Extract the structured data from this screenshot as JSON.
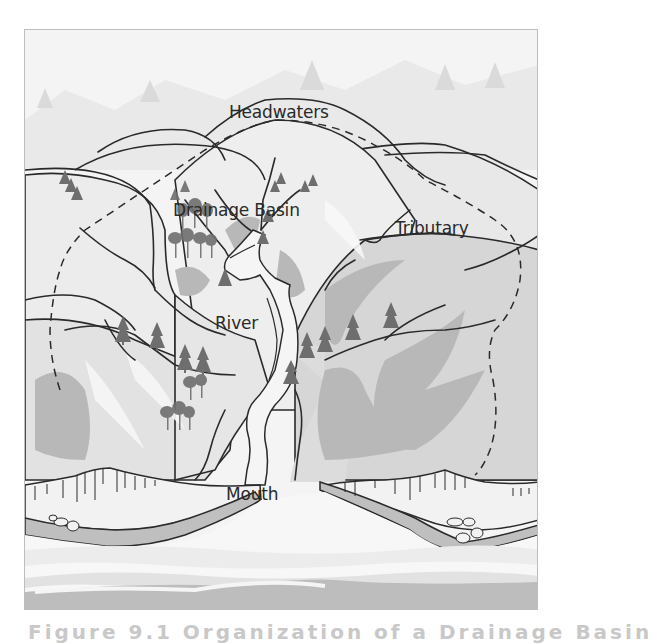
{
  "figure": {
    "caption": "Figure 9.1    Organization of a Drainage Basin",
    "colors": {
      "sky": "#f4f4f4",
      "hill_light": "#e6e6e6",
      "hill_mid": "#d2d2d2",
      "hill_shadow": "#b3b3b3",
      "river": "#f2f2f2",
      "water": "#dcdcdc",
      "outline": "#2a2a2a",
      "tree": "#6e6e6e"
    }
  },
  "labels": {
    "headwaters": "Headwaters",
    "drainage_basin": "Drainage Basin",
    "tributary": "Tributary",
    "river": "River",
    "mouth": "Mouth"
  }
}
